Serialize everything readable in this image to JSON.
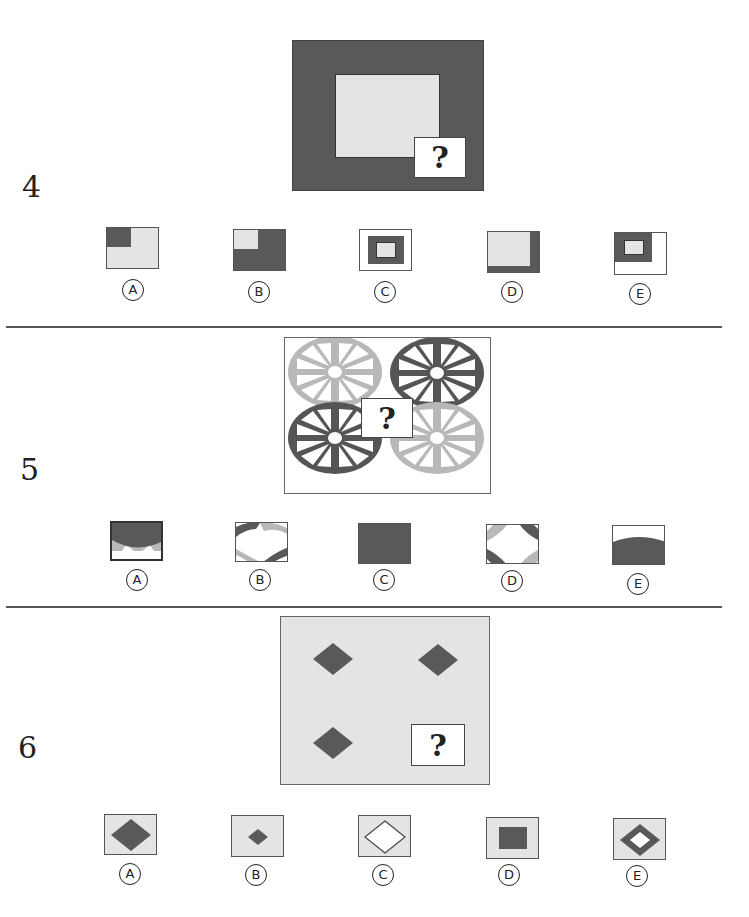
{
  "colors": {
    "dark": "#595959",
    "light": "#e4e4e4",
    "wheel_light": "#b8b8b8",
    "wheel_dark": "#555555",
    "white": "#ffffff",
    "border": "#555555"
  },
  "questions": [
    {
      "number": "4",
      "figure": {
        "description": "dark rectangle frame with light inner rectangle; missing lower-right piece",
        "missing_label": "?"
      },
      "options": [
        {
          "label": "A",
          "description": "light tile with dark top-left corner block"
        },
        {
          "label": "B",
          "description": "dark tile with light top-left corner block"
        },
        {
          "label": "C",
          "description": "white border, dark frame, light center"
        },
        {
          "label": "D",
          "description": "light tile with dark right and bottom edges"
        },
        {
          "label": "E",
          "description": "white tile with dark frame top-left enclosing light square"
        }
      ]
    },
    {
      "number": "5",
      "figure": {
        "description": "four overlapping spoked wheels: light top-left, dark top-right, dark bottom-left, light bottom-right",
        "missing_label": "?"
      },
      "options": [
        {
          "label": "A",
          "description": "dark top arc over light strip"
        },
        {
          "label": "B",
          "description": "arcs of dark and light wheel rims"
        },
        {
          "label": "C",
          "description": "solid dark square"
        },
        {
          "label": "D",
          "description": "four corner arcs around white center"
        },
        {
          "label": "E",
          "description": "dark mound rising from bottom"
        }
      ]
    },
    {
      "number": "6",
      "figure": {
        "description": "light gray panel with three dark diamonds; missing lower-right",
        "missing_label": "?"
      },
      "options": [
        {
          "label": "A",
          "description": "large dark diamond"
        },
        {
          "label": "B",
          "description": "small dark diamond"
        },
        {
          "label": "C",
          "description": "outlined diamond"
        },
        {
          "label": "D",
          "description": "dark square"
        },
        {
          "label": "E",
          "description": "dark diamond with white center"
        }
      ]
    }
  ]
}
